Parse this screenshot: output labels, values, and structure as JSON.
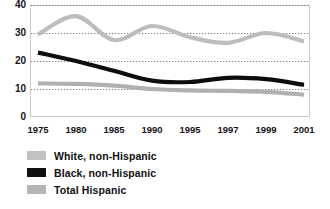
{
  "chart_data": {
    "type": "line",
    "title": "",
    "subtitle": "",
    "xlabel": "",
    "ylabel": "",
    "xlim": [
      1975,
      2001
    ],
    "ylim": [
      0,
      40
    ],
    "grid": true,
    "legend_position": "bottom-left",
    "categories": [
      "1975",
      "1980",
      "1985",
      "1990",
      "1995",
      "1997",
      "1999",
      "2001"
    ],
    "yticks": [
      "0",
      "10",
      "20",
      "30",
      "40"
    ],
    "series": [
      {
        "name": "White, non-Hispanic",
        "color": "#bdbdbd",
        "swatch": "#c2c2c2",
        "values": [
          29.5,
          36.0,
          27.5,
          32.5,
          28.5,
          26.5,
          30.0,
          27.0
        ]
      },
      {
        "name": "Black, non-Hispanic",
        "color": "#0d0d0d",
        "swatch": "#111111",
        "values": [
          23.0,
          20.0,
          16.5,
          13.0,
          12.5,
          14.0,
          13.5,
          11.5
        ]
      },
      {
        "name": "Total Hispanic",
        "color": "#b0b0b0",
        "swatch": "#b5b5b5",
        "values": [
          12.0,
          11.8,
          11.2,
          10.0,
          9.5,
          9.3,
          9.0,
          8.0
        ]
      }
    ]
  },
  "legend": {
    "items": [
      {
        "label": "White, non-Hispanic"
      },
      {
        "label": "Black, non-Hispanic"
      },
      {
        "label": "Total Hispanic"
      }
    ]
  }
}
